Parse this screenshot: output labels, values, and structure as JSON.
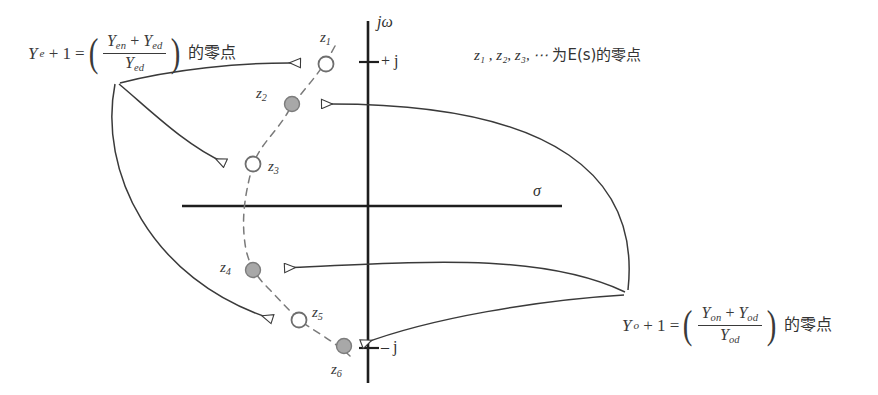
{
  "diagram": {
    "background_color": "#ffffff",
    "line_color": "#2a2a2a",
    "marker_fill_color": "#a8a8a8",
    "marker_stroke_color": "#6e6e6e"
  },
  "axes": {
    "imaginary_label": "jω",
    "real_label": "σ",
    "tick_plus_j": "+ j",
    "tick_minus_j": "– j"
  },
  "formula_left": {
    "lhs_symbol": "Y",
    "lhs_subscript": "e",
    "plus_one": "+ 1",
    "equals": "=",
    "numerator_first": "Y",
    "numerator_first_sub": "en",
    "numerator_plus": "+",
    "numerator_second": "Y",
    "numerator_second_sub": "ed",
    "denominator": "Y",
    "denominator_sub": "ed",
    "suffix_cjk": "的零点",
    "plain_text": "Y_e + 1 = ((Y_en + Y_ed) / Y_ed) 的零点"
  },
  "formula_right": {
    "lhs_symbol": "Y",
    "lhs_subscript": "o",
    "plus_one": "+ 1",
    "equals": "=",
    "numerator_first": "Y",
    "numerator_first_sub": "on",
    "numerator_plus": "+",
    "numerator_second": "Y",
    "numerator_second_sub": "od",
    "denominator": "Y",
    "denominator_sub": "od",
    "suffix_cjk": "的零点",
    "plain_text": "Y_o + 1 = ((Y_on + Y_od) / Y_od) 的零点"
  },
  "note": {
    "symbols": "z₁ , z₂, z₃, ⋯",
    "text_cjk": "为E(s)的零点",
    "plain_text": "z1 , z2, z3, ⋯ 为E(s)的零点"
  },
  "zeros": [
    {
      "id": "z1",
      "label": "z",
      "subscript": "1",
      "marker": "open",
      "x": 326,
      "y": 64,
      "label_x": 320,
      "label_y": 38,
      "group": "even"
    },
    {
      "id": "z2",
      "label": "z",
      "subscript": "2",
      "marker": "filled",
      "x": 292,
      "y": 104,
      "label_x": 258,
      "label_y": 92,
      "group": "odd"
    },
    {
      "id": "z3",
      "label": "z",
      "subscript": "3",
      "marker": "open",
      "x": 253,
      "y": 164,
      "label_x": 268,
      "label_y": 166,
      "group": "even"
    },
    {
      "id": "z4",
      "label": "z",
      "subscript": "4",
      "marker": "filled",
      "x": 253,
      "y": 270,
      "label_x": 222,
      "label_y": 266,
      "group": "odd"
    },
    {
      "id": "z5",
      "label": "z",
      "subscript": "5",
      "marker": "open",
      "x": 299,
      "y": 320,
      "label_x": 312,
      "label_y": 312,
      "group": "even"
    },
    {
      "id": "z6",
      "label": "z",
      "subscript": "6",
      "marker": "filled",
      "x": 344,
      "y": 346,
      "label_x": 330,
      "label_y": 372,
      "group": "odd"
    }
  ],
  "arrows_from_left_formula": [
    "z1",
    "z3",
    "z5"
  ],
  "arrows_from_right_formula": [
    "z2",
    "z4",
    "z6"
  ]
}
